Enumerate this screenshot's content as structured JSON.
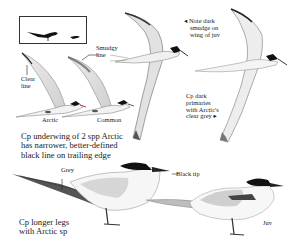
{
  "figure": {
    "inset": {
      "description": "silhouettes: adult tern and small juvenile"
    },
    "labels": {
      "smudgy_line": [
        "Smudgy",
        "line"
      ],
      "clear_line": [
        "Clear",
        "line"
      ],
      "arctic": "Arctic",
      "common": "Common",
      "note_dark": [
        "◂ Note dark",
        "smudge on",
        "wing of juv"
      ],
      "cp_dark_primaries": [
        "Cp dark",
        "primaries",
        "with Arctic's",
        "clear grey ▸"
      ],
      "cp_underwing": [
        "Cp underwing of 2 spp Arctic",
        "has narrower, better-defined",
        "black line on trailing edge"
      ],
      "grey": "Grey",
      "black_tip": "Black tip",
      "cp_longer_legs": [
        "Cp longer legs",
        "with Arctic sp"
      ],
      "juv": "Juv"
    },
    "colors": {
      "ink": "#1a1a1a",
      "wing_grey": "#d9d9d9",
      "mid_grey": "#a8a8a8",
      "cap_black": "#111111",
      "paper": "#ffffff"
    }
  }
}
